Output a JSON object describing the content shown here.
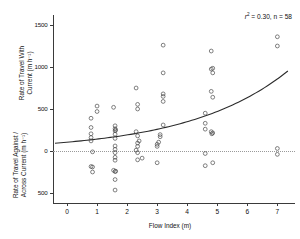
{
  "chart_data": {
    "type": "scatter",
    "title": "",
    "xlabel": "Flow Index (m)",
    "ylabel_upper": "Rate of Travel With Current (m h⁻¹)",
    "ylabel_lower": "Rate of Travel Against / Across Current (m h⁻¹)",
    "xlim": [
      -0.45,
      7.6
    ],
    "ylim": [
      -620,
      1620
    ],
    "xticks": [
      0,
      1,
      2,
      3,
      4,
      5,
      6,
      7
    ],
    "xticklabels": [
      "0",
      "1",
      "2",
      "3",
      "4",
      "5",
      "6",
      "7"
    ],
    "yticks": [
      1500,
      1000,
      500,
      0,
      -500
    ],
    "yticklabels": [
      "1500",
      "1000",
      "500",
      "0",
      "500"
    ],
    "grid": false,
    "legend": null,
    "zero_reference_line": 0,
    "annotations": [
      {
        "text": "r2 = 0.30, n = 58",
        "r_squared": 0.3,
        "n": 58,
        "x": 6.2,
        "y": 1480
      }
    ],
    "fit": {
      "form": "exponential",
      "description": "Rate = 105 * exp(0.30 * FlowIndex)",
      "a": 105,
      "b": 0.3,
      "x_start": -0.4,
      "x_end": 7.35
    },
    "points": [
      [
        0.8,
        390
      ],
      [
        0.8,
        280
      ],
      [
        0.8,
        205
      ],
      [
        0.8,
        160
      ],
      [
        0.8,
        120
      ],
      [
        0.85,
        -10
      ],
      [
        0.8,
        -185
      ],
      [
        0.85,
        -190
      ],
      [
        0.85,
        -250
      ],
      [
        1.0,
        535
      ],
      [
        1.0,
        470
      ],
      [
        1.55,
        520
      ],
      [
        1.6,
        300
      ],
      [
        1.6,
        265
      ],
      [
        1.62,
        250
      ],
      [
        1.6,
        240
      ],
      [
        1.6,
        200
      ],
      [
        1.6,
        150
      ],
      [
        1.6,
        60
      ],
      [
        1.6,
        20
      ],
      [
        1.6,
        -20
      ],
      [
        1.6,
        -75
      ],
      [
        1.6,
        -110
      ],
      [
        1.55,
        -230
      ],
      [
        1.62,
        -240
      ],
      [
        1.6,
        -245
      ],
      [
        1.6,
        -340
      ],
      [
        1.6,
        -465
      ],
      [
        2.3,
        750
      ],
      [
        2.35,
        555
      ],
      [
        2.35,
        500
      ],
      [
        2.3,
        230
      ],
      [
        2.35,
        180
      ],
      [
        2.4,
        120
      ],
      [
        2.35,
        95
      ],
      [
        2.35,
        55
      ],
      [
        2.3,
        10
      ],
      [
        2.35,
        -20
      ],
      [
        2.35,
        -105
      ],
      [
        2.5,
        -85
      ],
      [
        3.2,
        1260
      ],
      [
        3.2,
        930
      ],
      [
        3.2,
        680
      ],
      [
        3.2,
        650
      ],
      [
        3.2,
        590
      ],
      [
        3.2,
        310
      ],
      [
        3.1,
        195
      ],
      [
        3.1,
        170
      ],
      [
        3.05,
        105
      ],
      [
        3.0,
        80
      ],
      [
        3.0,
        55
      ],
      [
        3.0,
        -140
      ],
      [
        4.6,
        450
      ],
      [
        4.6,
        330
      ],
      [
        4.6,
        260
      ],
      [
        4.6,
        -175
      ],
      [
        4.6,
        -30
      ],
      [
        4.8,
        1190
      ],
      [
        4.8,
        975
      ],
      [
        4.85,
        985
      ],
      [
        4.85,
        930
      ],
      [
        4.8,
        710
      ],
      [
        4.85,
        640
      ],
      [
        4.8,
        230
      ],
      [
        4.85,
        215
      ],
      [
        4.82,
        205
      ],
      [
        4.85,
        -140
      ],
      [
        7.0,
        1360
      ],
      [
        7.0,
        1250
      ],
      [
        7.0,
        30
      ],
      [
        7.0,
        -40
      ]
    ]
  },
  "axes": {
    "x_axis_name": "flow-index-axis",
    "y_axis_name": "travel-rate-axis"
  }
}
